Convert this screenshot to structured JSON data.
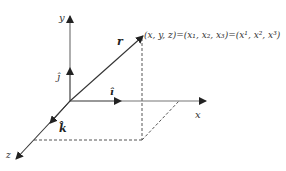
{
  "diagram": {
    "axes": {
      "x": {
        "label": "x"
      },
      "y": {
        "label": "y"
      },
      "z": {
        "label": "z"
      }
    },
    "unit_vectors": {
      "i": {
        "label": "î",
        "bold": true
      },
      "j": {
        "label": "ĵ"
      },
      "k": {
        "label": "k̂",
        "bold": true
      }
    },
    "position_vector": {
      "label": "r"
    },
    "point_label": "(x, y, z)=(x₁, x₂, x₃)=(x¹, x², x³)",
    "colors": {
      "axis": "#777777",
      "arrow_head": "#222222",
      "dashed": "#555555",
      "text": "#333333"
    }
  }
}
